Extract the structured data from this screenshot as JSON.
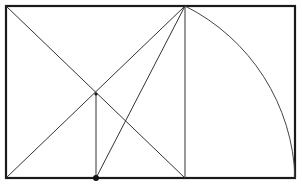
{
  "diagram": {
    "title": "Golden rectangle construction",
    "colors": {
      "stroke": "#1a1a1a",
      "background": "#ffffff"
    },
    "rectangle": {
      "x1": 6,
      "y1": 6,
      "x2": 295,
      "y2": 178
    },
    "points": {
      "top_left": [
        6,
        6
      ],
      "bottom_left": [
        6,
        178
      ],
      "apex": [
        185,
        6
      ],
      "apex_foot": [
        185,
        178
      ],
      "intersection": [
        96,
        94
      ],
      "base_point": [
        96,
        178
      ],
      "arc_end": [
        295,
        178
      ]
    },
    "arc": {
      "center": [
        96,
        178
      ],
      "radius": 199
    }
  }
}
